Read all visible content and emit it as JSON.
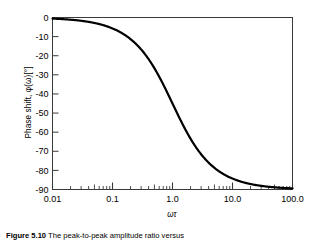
{
  "figure": {
    "caption_label": "Figure 5.10",
    "caption_text": "The peak-to-peak amplitude ratio versus",
    "ylabel_main": "Phase shift, ",
    "ylabel_symbol": "φ(ω)[°]",
    "xlabel": "ωτ"
  },
  "chart_data": {
    "type": "line",
    "title": "",
    "subtitle": "",
    "xlabel": "ωτ",
    "ylabel": "Phase shift, φ(ω)[°]",
    "xscale": "log",
    "yscale": "linear",
    "xlim": [
      0.01,
      100
    ],
    "ylim": [
      -90,
      0
    ],
    "grid": false,
    "legend": null,
    "xticklabels": [
      "0.01",
      "0.1",
      "1.0",
      "10.0",
      "100.0"
    ],
    "xtickvalues": [
      0.01,
      0.1,
      1.0,
      10.0,
      100.0
    ],
    "yticklabels": [
      "0",
      "-10",
      "-20",
      "-30",
      "-40",
      "-50",
      "-60",
      "-70",
      "-80",
      "-90"
    ],
    "ytickvalues": [
      0,
      -10,
      -20,
      -30,
      -40,
      -50,
      -60,
      -70,
      -80,
      -90
    ],
    "series": [
      {
        "name": "phase shift",
        "formula": "phi = -atan(omega*tau)",
        "color": "#000000",
        "linewidth": 2.2,
        "x": [
          0.01,
          0.0158,
          0.0251,
          0.0398,
          0.0631,
          0.1,
          0.1585,
          0.2512,
          0.3981,
          0.631,
          1.0,
          1.585,
          2.512,
          3.981,
          6.31,
          10.0,
          15.85,
          25.12,
          39.81,
          63.1,
          100.0
        ],
        "y": [
          -0.6,
          -0.9,
          -1.4,
          -2.3,
          -3.6,
          -5.7,
          -9.0,
          -14.1,
          -21.7,
          -32.3,
          -45.0,
          -57.7,
          -68.3,
          -75.9,
          -81.0,
          -84.3,
          -86.4,
          -87.7,
          -88.6,
          -89.1,
          -89.4
        ]
      }
    ],
    "annotations": []
  }
}
